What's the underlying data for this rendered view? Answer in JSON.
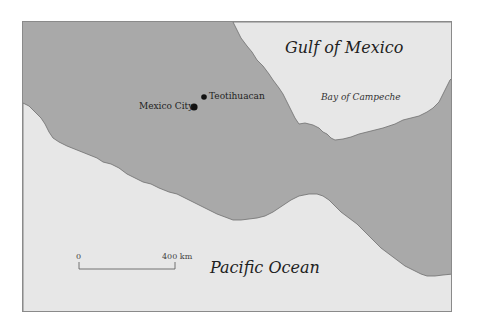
{
  "map": {
    "colors": {
      "land": "#a9a9a9",
      "water": "#e7e7e7",
      "coast": "#6e6e6e",
      "frame": "#8a8a8a",
      "text": "#1e1e1e"
    },
    "water_labels": {
      "gulf": "Gulf of Mexico",
      "bay": "Bay of Campeche",
      "pacific": "Pacific Ocean"
    },
    "cities": [
      {
        "name": "Teotihuacan",
        "marker": "small-dot"
      },
      {
        "name": "Mexico City",
        "marker": "large-dot"
      }
    ],
    "scale_bar": {
      "start": "0",
      "end": "400 km"
    }
  }
}
